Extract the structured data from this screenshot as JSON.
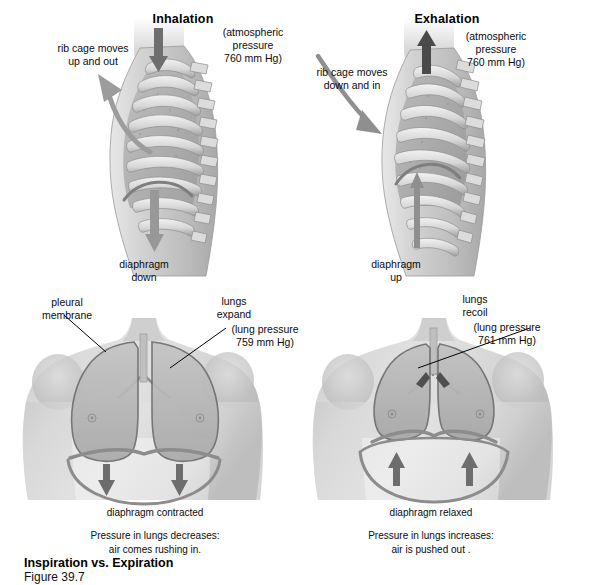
{
  "figure": {
    "title": "Inspiration vs. Expiration",
    "number": "Figure 39.7",
    "background_color": "#ffffff",
    "ink_color": "#000000",
    "art_tone_light": "#d9d9d9",
    "art_tone_mid": "#b2b2b2",
    "art_tone_dark": "#8a8a8a",
    "art_outline": "#5a5a5a"
  },
  "panels": {
    "left": {
      "heading": "Inhalation",
      "atmospheric_note": "(atmospheric\npressure\n760 mm Hg)",
      "ribcage_label": "rib cage moves\nup and out",
      "diaphragm_label": "diaphragm\ndown",
      "lungs_label": "lungs\nexpand",
      "lung_pressure_note": "(lung pressure\n759 mm Hg)",
      "pleural_label": "pleural\nmembrane",
      "diaphragm_state": "diaphragm contracted",
      "summary": "Pressure in lungs decreases:\nair comes rushing in.",
      "airflow_direction": "down-into-lungs",
      "airflow_arrow": "▼",
      "diaphragm_arrow": "▼"
    },
    "right": {
      "heading": "Exhalation",
      "atmospheric_note": "(atmospheric\npressure\n760 mm Hg)",
      "ribcage_label": "rib cage moves\ndown and in",
      "diaphragm_label": "diaphragm\nup",
      "lungs_label": "lungs\nrecoil",
      "lung_pressure_note": "(lung pressure\n761 mm Hg)",
      "diaphragm_state": "diaphragm relaxed",
      "summary": "Pressure in lungs increases:\nair is pushed out .",
      "airflow_direction": "up-out-of-lungs",
      "airflow_arrow": "▲",
      "diaphragm_arrow": "▲"
    }
  },
  "values": {
    "atmospheric_pressure_mm_hg": 760,
    "lung_pressure_inhalation_mm_hg": 759,
    "lung_pressure_exhalation_mm_hg": 761
  }
}
